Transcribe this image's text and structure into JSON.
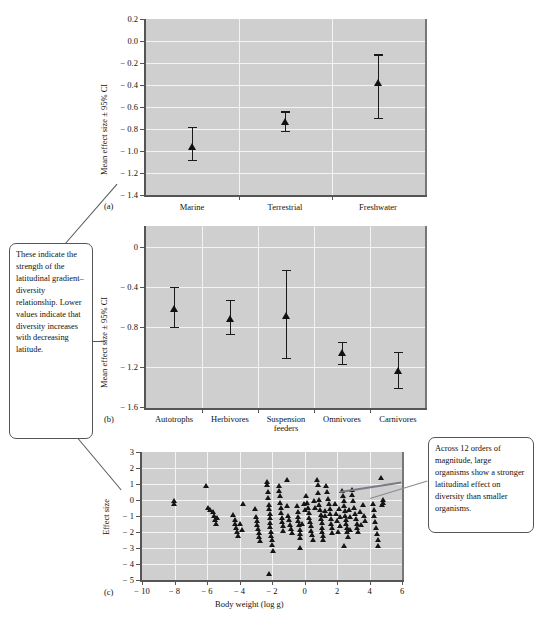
{
  "figure": {
    "panels": [
      "a",
      "b",
      "c"
    ],
    "marker_color": "#111111",
    "plot_background": "#cfcfcf",
    "gridline_color": "#f4f4f4"
  },
  "panel_a": {
    "letter": "(a)",
    "ylabel": "Mean effect size ± 95% CI",
    "yticks": [
      "0.2",
      "0.0",
      "− 0.2",
      "− 0.4",
      "− 0.6",
      "− 0.8",
      "− 1.0",
      "− 1.2",
      "− 1.4"
    ],
    "xticklabels": [
      "Marine",
      "Terrestrial",
      "Freshwater"
    ]
  },
  "panel_b": {
    "letter": "(b)",
    "ylabel": "Mean effect size ± 95% CI",
    "yticks": [
      "0",
      "− 0.4",
      "− 0.8",
      "− 1.2",
      "− 1.6"
    ],
    "xticklabels": [
      "Autotrophs",
      "Herbivores",
      "Suspension\nfeeders",
      "Omnivores",
      "Carnivores"
    ]
  },
  "panel_c": {
    "letter": "(c)",
    "ylabel": "Effect size",
    "xlabel": "Body weight (log g)",
    "yticks": [
      "3",
      "2",
      "1",
      "0",
      "− 1",
      "− 2",
      "− 3",
      "− 4",
      "− 5"
    ],
    "xticks": [
      "− 10",
      "− 8",
      "− 6",
      "− 4",
      "− 2",
      "0",
      "2",
      "4",
      "6"
    ]
  },
  "callouts": {
    "left": {
      "text": "These indicate the strength of the latitudinal gradient–diversity relationship. Lower values indicate that diversity increases with decreasing latitude."
    },
    "right": {
      "text": "Across 12 orders of magnitude, large organisms show a stronger latitudinal effect on diversity than smaller organisms."
    }
  },
  "chart_data": [
    {
      "id": "panel_a",
      "type": "scatter",
      "title": "",
      "xlabel": "",
      "ylabel": "Mean effect size ± 95% CI",
      "ylim": [
        -1.4,
        0.2
      ],
      "ytick_values": [
        0.2,
        0.0,
        -0.2,
        -0.4,
        -0.6,
        -0.8,
        -1.0,
        -1.2,
        -1.4
      ],
      "grid": true,
      "legend": "none",
      "categories": [
        "Marine",
        "Terrestrial",
        "Freshwater"
      ],
      "values": [
        -1.13,
        -0.91,
        -0.42
      ],
      "ci_low": [
        -1.27,
        -1.0,
        -0.7
      ],
      "ci_high": [
        -0.97,
        -0.82,
        -0.12
      ]
    },
    {
      "id": "panel_b",
      "type": "scatter",
      "title": "",
      "xlabel": "",
      "ylabel": "Mean effect size ± 95% CI",
      "ylim": [
        -1.6,
        0.15
      ],
      "ytick_values": [
        0,
        -0.4,
        -0.8,
        -1.2,
        -1.6
      ],
      "grid": true,
      "legend": "none",
      "categories": [
        "Autotrophs",
        "Herbivores",
        "Suspension feeders",
        "Omnivores",
        "Carnivores"
      ],
      "values": [
        -0.62,
        -0.72,
        -0.69,
        -1.06,
        -1.24
      ],
      "ci_low": [
        -0.8,
        -0.87,
        -1.11,
        -1.17,
        -1.41
      ],
      "ci_high": [
        -0.4,
        -0.53,
        -0.23,
        -0.95,
        -1.05
      ]
    },
    {
      "id": "panel_c",
      "type": "scatter",
      "title": "",
      "xlabel": "Body weight (log g)",
      "ylabel": "Effect size",
      "xlim": [
        -10,
        6
      ],
      "ylim": [
        -5,
        3
      ],
      "xtick_values": [
        -10,
        -8,
        -6,
        -4,
        -2,
        0,
        2,
        4,
        6
      ],
      "ytick_values": [
        3,
        2,
        1,
        0,
        -1,
        -2,
        -3,
        -4,
        -5
      ],
      "grid": true,
      "legend": "none",
      "trendline": {
        "x0": 2.2,
        "y0": 0.55,
        "x1": 6.0,
        "y1": 1.15
      },
      "points": [
        [
          -8.05,
          -0.05
        ],
        [
          -8.05,
          -0.25
        ],
        [
          -6.05,
          0.9
        ],
        [
          -5.95,
          -0.45
        ],
        [
          -5.8,
          -0.6
        ],
        [
          -5.65,
          -0.75
        ],
        [
          -5.55,
          -0.95
        ],
        [
          -5.5,
          -1.25
        ],
        [
          -5.45,
          -1.45
        ],
        [
          -5.4,
          -1.1
        ],
        [
          -4.4,
          -0.9
        ],
        [
          -4.3,
          -1.25
        ],
        [
          -4.25,
          -1.5
        ],
        [
          -4.2,
          -1.7
        ],
        [
          -4.15,
          -1.95
        ],
        [
          -4.1,
          -2.25
        ],
        [
          -3.95,
          -1.5
        ],
        [
          -3.85,
          -1.85
        ],
        [
          -3.8,
          -0.25
        ],
        [
          -3.05,
          -0.55
        ],
        [
          -3.0,
          -1.05
        ],
        [
          -2.95,
          -1.3
        ],
        [
          -2.9,
          -1.55
        ],
        [
          -2.85,
          -1.8
        ],
        [
          -2.8,
          -2.05
        ],
        [
          -2.78,
          -2.3
        ],
        [
          -2.72,
          -2.55
        ],
        [
          -2.3,
          1.15
        ],
        [
          -2.3,
          0.95
        ],
        [
          -2.25,
          0.55
        ],
        [
          -2.25,
          0.15
        ],
        [
          -2.2,
          -0.3
        ],
        [
          -2.2,
          -0.55
        ],
        [
          -2.15,
          -0.85
        ],
        [
          -2.15,
          -1.1
        ],
        [
          -2.12,
          -1.4
        ],
        [
          -2.1,
          -1.65
        ],
        [
          -2.08,
          -1.95
        ],
        [
          -2.05,
          -2.2
        ],
        [
          -2.0,
          -2.45
        ],
        [
          -1.98,
          -2.8
        ],
        [
          -1.95,
          -3.15
        ],
        [
          -2.2,
          -4.6
        ],
        [
          -1.6,
          0.9
        ],
        [
          -1.55,
          0.6
        ],
        [
          -1.5,
          0.25
        ],
        [
          -1.48,
          -0.15
        ],
        [
          -1.45,
          -0.5
        ],
        [
          -1.42,
          -0.8
        ],
        [
          -1.4,
          -1.1
        ],
        [
          -1.38,
          -1.35
        ],
        [
          -1.35,
          -1.6
        ],
        [
          -1.3,
          -1.9
        ],
        [
          -1.1,
          1.25
        ],
        [
          -1.05,
          -0.35
        ],
        [
          -1.0,
          -0.95
        ],
        [
          -0.95,
          -1.25
        ],
        [
          -0.9,
          -1.55
        ],
        [
          -0.85,
          -1.8
        ],
        [
          -0.8,
          -2.05
        ],
        [
          -0.45,
          -0.35
        ],
        [
          -0.42,
          -0.7
        ],
        [
          -0.4,
          -1.05
        ],
        [
          -0.38,
          -1.3
        ],
        [
          -0.35,
          -1.55
        ],
        [
          -0.3,
          -1.85
        ],
        [
          -0.28,
          -2.1
        ],
        [
          -0.25,
          -2.35
        ],
        [
          -0.3,
          -2.95
        ],
        [
          0.1,
          0.25
        ],
        [
          0.15,
          -0.15
        ],
        [
          0.2,
          -0.45
        ],
        [
          0.25,
          -0.8
        ],
        [
          0.3,
          -1.1
        ],
        [
          0.35,
          -1.35
        ],
        [
          0.38,
          -1.6
        ],
        [
          0.42,
          -1.9
        ],
        [
          0.45,
          -2.15
        ],
        [
          0.5,
          -2.45
        ],
        [
          0.75,
          1.3
        ],
        [
          0.8,
          0.95
        ],
        [
          0.85,
          0.45
        ],
        [
          0.88,
          0.05
        ],
        [
          0.92,
          -0.3
        ],
        [
          0.95,
          -0.6
        ],
        [
          1.0,
          -0.9
        ],
        [
          1.02,
          -1.15
        ],
        [
          1.05,
          -1.4
        ],
        [
          1.08,
          -1.7
        ],
        [
          1.1,
          -1.95
        ],
        [
          1.12,
          -2.2
        ],
        [
          1.15,
          -2.5
        ],
        [
          1.35,
          0.9
        ],
        [
          1.4,
          0.55
        ],
        [
          1.45,
          0.1
        ],
        [
          1.5,
          -0.25
        ],
        [
          1.55,
          -0.55
        ],
        [
          1.58,
          -0.85
        ],
        [
          1.62,
          -1.15
        ],
        [
          1.65,
          -1.45
        ],
        [
          1.7,
          -1.75
        ],
        [
          1.72,
          -2.05
        ],
        [
          1.9,
          -0.2
        ],
        [
          1.95,
          -0.85
        ],
        [
          2.0,
          -1.3
        ],
        [
          2.05,
          -1.95
        ],
        [
          2.3,
          0.6
        ],
        [
          2.35,
          0.3
        ],
        [
          2.4,
          -0.05
        ],
        [
          2.45,
          -0.35
        ],
        [
          2.5,
          -0.65
        ],
        [
          2.52,
          -0.95
        ],
        [
          2.55,
          -1.25
        ],
        [
          2.58,
          -1.5
        ],
        [
          2.6,
          -1.75
        ],
        [
          2.62,
          -2.0
        ],
        [
          2.65,
          -2.3
        ],
        [
          2.45,
          -2.85
        ],
        [
          2.9,
          0.65
        ],
        [
          2.95,
          0.35
        ],
        [
          3.0,
          -0.05
        ],
        [
          3.05,
          -0.45
        ],
        [
          3.1,
          -0.85
        ],
        [
          3.15,
          -1.15
        ],
        [
          3.2,
          -1.45
        ],
        [
          3.25,
          -1.75
        ],
        [
          3.3,
          -2.0
        ],
        [
          3.6,
          -0.3
        ],
        [
          3.65,
          -0.95
        ],
        [
          3.7,
          -1.3
        ],
        [
          4.2,
          -0.25
        ],
        [
          4.25,
          -0.6
        ],
        [
          4.3,
          -1.0
        ],
        [
          4.35,
          -1.35
        ],
        [
          4.4,
          -1.75
        ],
        [
          4.45,
          -2.1
        ],
        [
          4.5,
          -2.45
        ],
        [
          4.55,
          -2.85
        ],
        [
          4.7,
          1.4
        ],
        [
          4.75,
          -0.3
        ],
        [
          4.8,
          0.0
        ],
        [
          4.85,
          -0.15
        ],
        [
          -0.05,
          -0.2
        ],
        [
          0.05,
          -0.6
        ],
        [
          -0.15,
          -1.45
        ],
        [
          0.6,
          -0.05
        ],
        [
          0.65,
          -0.45
        ],
        [
          1.25,
          -0.65
        ],
        [
          1.28,
          -1.0
        ],
        [
          2.15,
          -0.55
        ],
        [
          2.18,
          -1.05
        ],
        [
          2.2,
          -1.6
        ],
        [
          3.42,
          -0.7
        ],
        [
          3.45,
          -1.55
        ],
        [
          2.75,
          -0.6
        ],
        [
          2.78,
          -1.05
        ],
        [
          2.82,
          -1.85
        ]
      ]
    }
  ]
}
